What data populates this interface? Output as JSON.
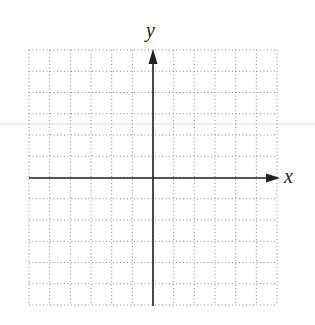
{
  "figure": {
    "type": "coordinate-grid",
    "x_axis_label": "x",
    "y_axis_label": "y",
    "grid": {
      "left": 29,
      "right": 277,
      "top": 50,
      "bottom": 305,
      "spacing_x": 20.67,
      "spacing_y": 21.25,
      "cols": 12,
      "rows": 12,
      "line_style": "dotted",
      "line_color": "#8a8a8a"
    },
    "origin": {
      "x": 153,
      "y": 178
    },
    "axis_color": "#222222",
    "stray_line": {
      "y": 124,
      "color": "#d8d8d8"
    }
  }
}
